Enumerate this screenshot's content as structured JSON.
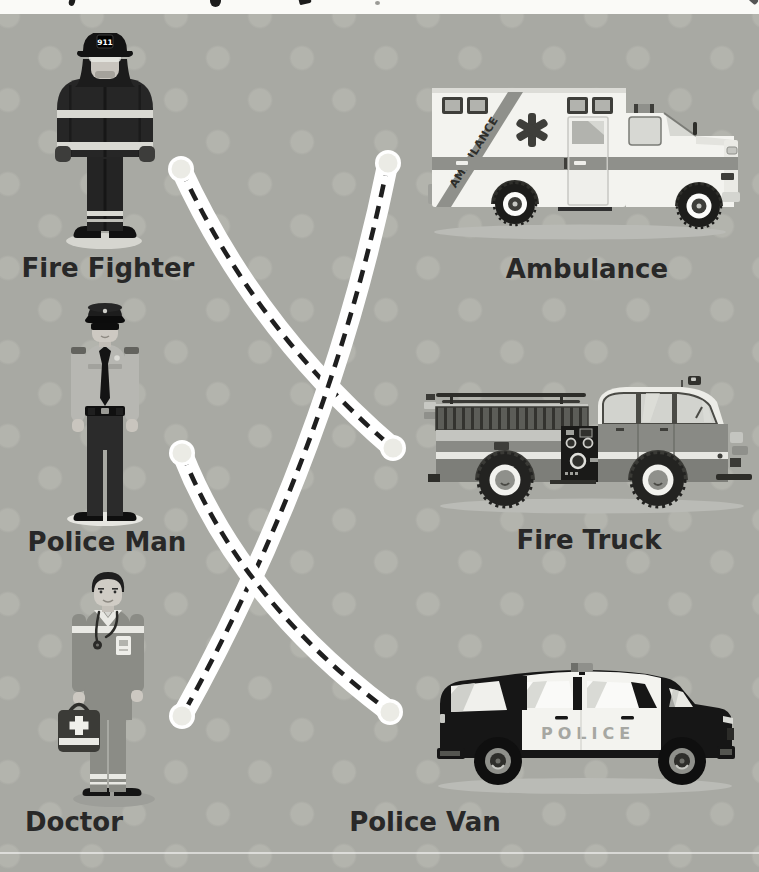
{
  "worksheet": {
    "left_column": [
      {
        "label": "Fire Fighter",
        "icon": "fire-fighter-figure"
      },
      {
        "label": "Police Man",
        "icon": "police-man-figure"
      },
      {
        "label": "Doctor",
        "icon": "doctor-figure"
      }
    ],
    "right_column": [
      {
        "label": "Ambulance",
        "icon": "ambulance-vehicle"
      },
      {
        "label": "Fire Truck",
        "icon": "fire-truck-vehicle"
      },
      {
        "label": "Police Van",
        "icon": "police-van-vehicle"
      }
    ],
    "connections": [
      {
        "from": "Fire Fighter",
        "to": "Fire Truck"
      },
      {
        "from": "Ambulance",
        "to": "Doctor"
      },
      {
        "from": "Police Man",
        "to": "Police Van"
      }
    ]
  },
  "illustrations": {
    "firefighter_helmet_badge": "911",
    "ambulance_stripe_text": "AMBULANCE",
    "police_van_text": "POLICE"
  },
  "theme": {
    "css_vars": {
      "--bg": "#a8a9a3",
      "--dot": "#b3b4ad",
      "--ink": "#282828",
      "--strip": "#fafaf7",
      "--line-white": "#ffffff",
      "--dash": "#1f1f1f",
      "--cap": "#ebebe5"
    }
  }
}
